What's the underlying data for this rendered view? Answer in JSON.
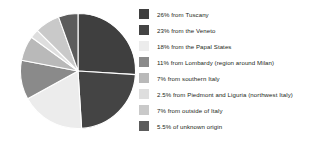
{
  "chart_data": {
    "type": "pie",
    "title": "",
    "xlabel": "",
    "ylabel": "",
    "legend_position": "right",
    "grid": false,
    "start_angle_deg": 0,
    "direction": "clockwise",
    "categories": [
      "from Tuscany",
      "from the Veneto",
      "from the Papal States",
      "from Lombardy (region around Milan)",
      "from southern Italy",
      "from Piedmont and Liguria (northwest Italy)",
      "from outside of Italy",
      "of unknown origin"
    ],
    "values": [
      26,
      23,
      18,
      11,
      7,
      2.5,
      7,
      5.5
    ],
    "value_labels": [
      "26%",
      "23%",
      "18%",
      "11%",
      "7%",
      "2.5%",
      "7%",
      "5.5%"
    ],
    "colors": [
      "#3f3f3f",
      "#444444",
      "#ececec",
      "#8a8a8a",
      "#b9b9b9",
      "#dedede",
      "#c9c9c9",
      "#5c5c5c"
    ],
    "slice_stroke": "#ffffff",
    "slice_stroke_width": 1.1
  },
  "legend": {
    "items": [
      {
        "label": "26% from Tuscany",
        "color": "#3f3f3f",
        "swatch_name": "legend-swatch-tuscany"
      },
      {
        "label": "23% from the Veneto",
        "color": "#444444",
        "swatch_name": "legend-swatch-veneto"
      },
      {
        "label": "18% from the Papal States",
        "color": "#ececec",
        "swatch_name": "legend-swatch-papal-states"
      },
      {
        "label": "11% from Lombardy (region around Milan)",
        "color": "#8a8a8a",
        "swatch_name": "legend-swatch-lombardy"
      },
      {
        "label": "7% from southern Italy",
        "color": "#b9b9b9",
        "swatch_name": "legend-swatch-southern-italy"
      },
      {
        "label": "2.5% from Piedmont and Liguria (northwest Italy)",
        "color": "#dedede",
        "swatch_name": "legend-swatch-piedmont-liguria"
      },
      {
        "label": "7% from outside of Italy",
        "color": "#c9c9c9",
        "swatch_name": "legend-swatch-outside-italy"
      },
      {
        "label": "5.5% of unknown origin",
        "color": "#5c5c5c",
        "swatch_name": "legend-swatch-unknown-origin"
      }
    ]
  }
}
